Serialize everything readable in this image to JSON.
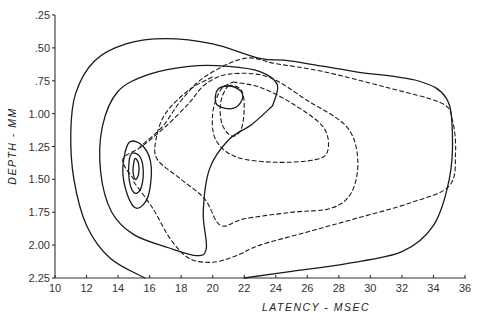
{
  "chart_data": {
    "type": "contour",
    "title": "",
    "xlabel": "LATENCY - MSEC",
    "ylabel": "DEPTH - MM",
    "xlim": [
      10,
      36
    ],
    "ylim": [
      2.25,
      0.25
    ],
    "y_inverted": true,
    "grid": false,
    "legend": null,
    "x_ticks": [
      10,
      12,
      14,
      16,
      18,
      20,
      22,
      24,
      26,
      28,
      30,
      32,
      34,
      36
    ],
    "x_tick_labels": [
      "10",
      "12",
      "14",
      "16",
      "18",
      "20",
      "22",
      "24",
      "26",
      "28",
      "30",
      "32",
      "34",
      "36"
    ],
    "y_ticks": [
      0.25,
      0.5,
      0.75,
      1.0,
      1.25,
      1.5,
      1.75,
      2.0,
      2.25
    ],
    "y_tick_labels": [
      ".25",
      ".50",
      ".75",
      "1.00",
      "1.25",
      "1.50",
      "1.75",
      "2.00",
      "2.25"
    ],
    "series": [
      {
        "name": "solid-outer",
        "style": "solid",
        "closed": false,
        "points": [
          [
            15.7,
            2.25
          ],
          [
            13.5,
            2.1
          ],
          [
            12.0,
            1.85
          ],
          [
            11.2,
            1.5
          ],
          [
            11.0,
            1.15
          ],
          [
            11.3,
            0.85
          ],
          [
            12.5,
            0.6
          ],
          [
            14.5,
            0.47
          ],
          [
            17.0,
            0.43
          ],
          [
            20.0,
            0.47
          ],
          [
            23.0,
            0.58
          ],
          [
            25.0,
            0.6
          ],
          [
            29.0,
            0.68
          ],
          [
            33.0,
            0.75
          ],
          [
            34.8,
            0.88
          ],
          [
            35.2,
            1.15
          ],
          [
            35.0,
            1.5
          ],
          [
            34.0,
            1.85
          ],
          [
            32.0,
            2.05
          ],
          [
            28.5,
            2.14
          ],
          [
            25.0,
            2.2
          ],
          [
            22.0,
            2.25
          ]
        ]
      },
      {
        "name": "solid-second",
        "style": "solid",
        "closed": false,
        "points": [
          [
            23.8,
            0.94
          ],
          [
            22.5,
            1.08
          ],
          [
            21.0,
            1.2
          ],
          [
            19.8,
            1.42
          ],
          [
            19.4,
            1.75
          ],
          [
            19.6,
            2.02
          ],
          [
            19.0,
            2.08
          ],
          [
            17.2,
            2.02
          ],
          [
            15.0,
            1.92
          ],
          [
            13.6,
            1.75
          ],
          [
            12.9,
            1.45
          ],
          [
            13.0,
            1.1
          ],
          [
            14.0,
            0.83
          ],
          [
            16.0,
            0.7
          ],
          [
            18.5,
            0.64
          ],
          [
            21.0,
            0.64
          ],
          [
            23.0,
            0.68
          ],
          [
            24.1,
            0.78
          ],
          [
            23.8,
            0.94
          ]
        ]
      },
      {
        "name": "solid-peak-left-1",
        "style": "solid",
        "closed": true,
        "points": [
          [
            14.7,
            1.22
          ],
          [
            15.6,
            1.25
          ],
          [
            16.1,
            1.4
          ],
          [
            15.9,
            1.63
          ],
          [
            15.2,
            1.72
          ],
          [
            14.6,
            1.62
          ],
          [
            14.3,
            1.42
          ],
          [
            14.7,
            1.22
          ]
        ]
      },
      {
        "name": "solid-peak-left-2",
        "style": "solid",
        "closed": true,
        "points": [
          [
            14.9,
            1.3
          ],
          [
            15.4,
            1.33
          ],
          [
            15.6,
            1.45
          ],
          [
            15.4,
            1.58
          ],
          [
            15.0,
            1.6
          ],
          [
            14.7,
            1.5
          ],
          [
            14.7,
            1.36
          ],
          [
            14.9,
            1.3
          ]
        ]
      },
      {
        "name": "solid-peak-left-3",
        "style": "solid",
        "closed": true,
        "points": [
          [
            15.1,
            1.34
          ],
          [
            15.3,
            1.38
          ],
          [
            15.3,
            1.46
          ],
          [
            15.1,
            1.5
          ],
          [
            14.95,
            1.44
          ],
          [
            15.0,
            1.37
          ],
          [
            15.1,
            1.34
          ]
        ]
      },
      {
        "name": "solid-peak-top",
        "style": "solid",
        "closed": true,
        "points": [
          [
            20.3,
            0.82
          ],
          [
            21.0,
            0.79
          ],
          [
            21.7,
            0.82
          ],
          [
            21.9,
            0.88
          ],
          [
            21.5,
            0.95
          ],
          [
            20.8,
            0.96
          ],
          [
            20.2,
            0.92
          ],
          [
            20.3,
            0.82
          ]
        ]
      },
      {
        "name": "dashed-inner-top",
        "style": "dashed",
        "closed": true,
        "points": [
          [
            21.0,
            0.79
          ],
          [
            21.8,
            0.82
          ],
          [
            22.0,
            0.95
          ],
          [
            21.8,
            1.12
          ],
          [
            21.2,
            1.17
          ],
          [
            20.6,
            1.08
          ],
          [
            20.5,
            0.92
          ],
          [
            21.0,
            0.79
          ]
        ]
      },
      {
        "name": "dashed-second",
        "style": "dashed",
        "closed": false,
        "points": [
          [
            21.3,
            0.76
          ],
          [
            23.0,
            0.8
          ],
          [
            25.0,
            0.92
          ],
          [
            27.0,
            1.1
          ],
          [
            27.3,
            1.28
          ],
          [
            26.5,
            1.35
          ],
          [
            24.0,
            1.37
          ],
          [
            21.5,
            1.33
          ],
          [
            20.2,
            1.2
          ],
          [
            20.0,
            1.0
          ],
          [
            20.5,
            0.82
          ],
          [
            21.3,
            0.76
          ]
        ]
      },
      {
        "name": "dashed-third",
        "style": "dashed",
        "closed": false,
        "points": [
          [
            15.0,
            1.5
          ],
          [
            14.3,
            1.35
          ],
          [
            15.5,
            1.25
          ],
          [
            17.0,
            1.1
          ],
          [
            18.5,
            0.92
          ],
          [
            19.5,
            0.78
          ],
          [
            21.0,
            0.7
          ],
          [
            23.5,
            0.72
          ],
          [
            26.0,
            0.9
          ],
          [
            28.5,
            1.1
          ],
          [
            29.2,
            1.35
          ],
          [
            28.8,
            1.6
          ],
          [
            27.5,
            1.72
          ],
          [
            25.0,
            1.75
          ],
          [
            22.0,
            1.8
          ],
          [
            20.5,
            1.85
          ],
          [
            19.5,
            1.65
          ],
          [
            18.0,
            1.5
          ],
          [
            16.5,
            1.35
          ],
          [
            16.4,
            1.2
          ],
          [
            17.0,
            1.0
          ],
          [
            18.5,
            0.82
          ],
          [
            20.0,
            0.72
          ]
        ]
      },
      {
        "name": "dashed-outer",
        "style": "dashed",
        "closed": false,
        "points": [
          [
            15.0,
            1.52
          ],
          [
            16.2,
            1.72
          ],
          [
            17.3,
            1.95
          ],
          [
            18.5,
            2.1
          ],
          [
            20.0,
            2.13
          ],
          [
            21.5,
            2.08
          ],
          [
            23.0,
            2.0
          ],
          [
            26.0,
            1.9
          ],
          [
            29.0,
            1.8
          ],
          [
            32.5,
            1.68
          ],
          [
            35.0,
            1.55
          ],
          [
            35.4,
            1.3
          ],
          [
            35.2,
            1.05
          ],
          [
            34.5,
            0.92
          ],
          [
            31.0,
            0.8
          ],
          [
            27.0,
            0.68
          ],
          [
            24.0,
            0.62
          ],
          [
            22.0,
            0.58
          ],
          [
            19.5,
            0.72
          ],
          [
            18.0,
            0.9
          ],
          [
            16.8,
            1.1
          ],
          [
            15.4,
            1.25
          ]
        ]
      }
    ]
  }
}
